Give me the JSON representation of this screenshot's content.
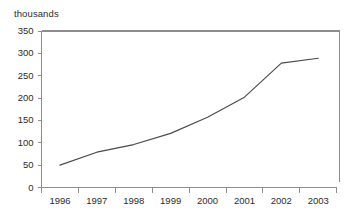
{
  "chart_data": {
    "type": "line",
    "title": "",
    "subtitle": "",
    "unit_label": "thousands",
    "xlabel": "",
    "ylabel": "",
    "categories": [
      "1996",
      "1997",
      "1998",
      "1999",
      "2000",
      "2001",
      "2002",
      "2003"
    ],
    "x": [
      1996,
      1997,
      1998,
      1999,
      2000,
      2001,
      2002,
      2003
    ],
    "values": [
      50,
      79,
      96,
      121,
      157,
      202,
      278,
      289
    ],
    "series": [
      {
        "name": "",
        "values": [
          50,
          79,
          96,
          121,
          157,
          202,
          278,
          289
        ],
        "color": "#4a4a4a"
      }
    ],
    "ylim": [
      0,
      350
    ],
    "yticks": [
      0,
      50,
      100,
      150,
      200,
      250,
      300,
      350
    ],
    "ytick_labels": [
      "0",
      "50",
      "100",
      "150",
      "200",
      "250",
      "300",
      "350"
    ],
    "xtick_labels": [
      "1996",
      "1997",
      "1998",
      "1999",
      "2000",
      "2001",
      "2002",
      "2003"
    ],
    "grid": false,
    "legend": false,
    "legend_position": "none",
    "axis_color": "#8d8d8d",
    "line_color": "#4a4a4a",
    "background_color": "#ffffff",
    "annotations": []
  }
}
